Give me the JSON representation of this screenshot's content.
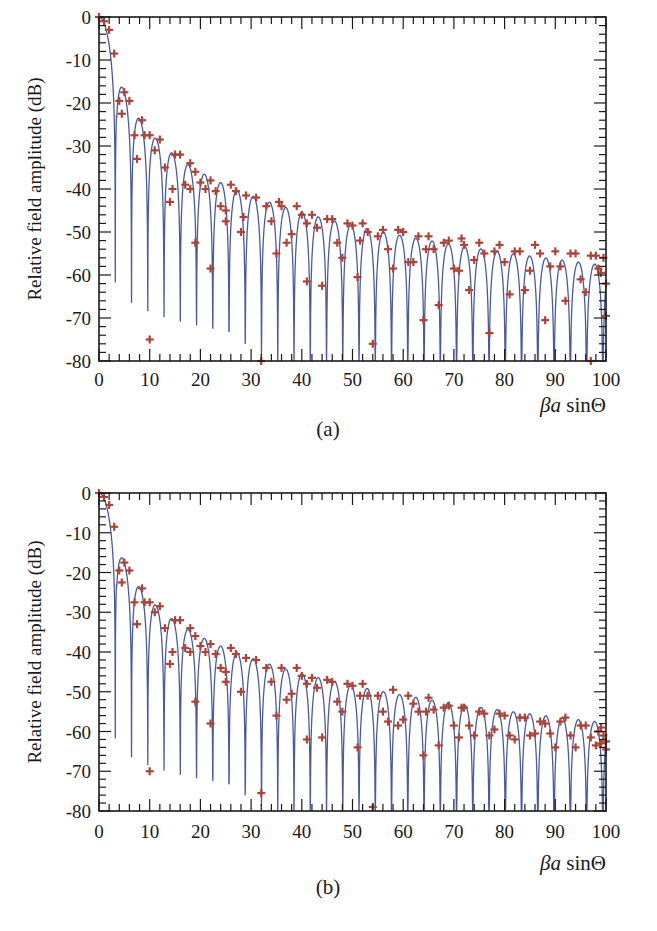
{
  "figure": {
    "panels": [
      {
        "id": "a",
        "caption": "(a)",
        "ylabel": "Relative field amplitude (dB)",
        "xlabel_prefix": "βa",
        "xlabel_func": "sin",
        "xlabel_var": "Θ"
      },
      {
        "id": "b",
        "caption": "(b)",
        "ylabel": "Relative field amplitude (dB)",
        "xlabel_prefix": "βa",
        "xlabel_func": "sin",
        "xlabel_var": "Θ"
      }
    ],
    "x_ticks": [
      "0",
      "10",
      "20",
      "30",
      "40",
      "50",
      "60",
      "70",
      "80",
      "90",
      "100"
    ],
    "y_ticks": [
      "0",
      "-10",
      "-20",
      "-30",
      "-40",
      "-50",
      "-60",
      "-70",
      "-80"
    ],
    "colors": {
      "line": "#4a5a9a",
      "marker": "#a8443a",
      "axis": "#1a1a1a"
    }
  },
  "chart_data": [
    {
      "type": "line",
      "title": "(a)",
      "xlabel": "βa sinΘ",
      "ylabel": "Relative field amplitude (dB)",
      "xlim": [
        0,
        100
      ],
      "ylim": [
        -80,
        0
      ],
      "grid": false,
      "series": [
        {
          "name": "theory (line)",
          "kind": "line",
          "description": "Sidelobe pattern with nulls at ~3.8, 7.0, 10.2, 13.3, 16.5, ... spacing ~pi; peaks decay from 0 dB to about -56 dB at x=100",
          "peaks": [
            [
              0,
              0
            ],
            [
              5.1,
              -17.6
            ],
            [
              8.4,
              -24
            ],
            [
              11.6,
              -28
            ],
            [
              14.8,
              -31.5
            ],
            [
              17.9,
              -34
            ],
            [
              21.1,
              -36
            ],
            [
              24.2,
              -38
            ],
            [
              27.4,
              -39.5
            ],
            [
              30.5,
              -41
            ],
            [
              33.7,
              -42.5
            ],
            [
              36.8,
              -43.5
            ],
            [
              40,
              -44.5
            ],
            [
              43.1,
              -45.5
            ],
            [
              46.3,
              -46.5
            ],
            [
              49.4,
              -47.5
            ],
            [
              52.6,
              -48
            ],
            [
              55.7,
              -49
            ],
            [
              58.9,
              -49.5
            ],
            [
              62,
              -50
            ],
            [
              65.2,
              -50.5
            ],
            [
              68.3,
              -51
            ],
            [
              71.5,
              -51.5
            ],
            [
              74.6,
              -52
            ],
            [
              77.8,
              -52.5
            ],
            [
              80.9,
              -53
            ],
            [
              84.1,
              -53.5
            ],
            [
              87.2,
              -54
            ],
            [
              90.4,
              -54.5
            ],
            [
              93.5,
              -55
            ],
            [
              96.7,
              -55.5
            ],
            [
              99.8,
              -56
            ]
          ]
        },
        {
          "name": "computed (markers)",
          "kind": "scatter",
          "marker": "+",
          "points": [
            [
              0,
              0
            ],
            [
              1,
              -1
            ],
            [
              2,
              -3
            ],
            [
              3,
              -8.5
            ],
            [
              4,
              -19.5
            ],
            [
              4.5,
              -22.5
            ],
            [
              5,
              -17.5
            ],
            [
              6,
              -19.5
            ],
            [
              7,
              -27.5
            ],
            [
              7.5,
              -33
            ],
            [
              8.5,
              -24
            ],
            [
              9,
              -27.5
            ],
            [
              10,
              -75
            ],
            [
              10,
              -27.5
            ],
            [
              11,
              -31
            ],
            [
              12,
              -28.5
            ],
            [
              13,
              -35
            ],
            [
              14,
              -43
            ],
            [
              14.5,
              -40
            ],
            [
              15,
              -32
            ],
            [
              16,
              -32
            ],
            [
              17,
              -39
            ],
            [
              18,
              -40
            ],
            [
              18,
              -34
            ],
            [
              19,
              -36
            ],
            [
              19,
              -52.5
            ],
            [
              20,
              -38.5
            ],
            [
              21,
              -40
            ],
            [
              22,
              -38
            ],
            [
              22,
              -58.5
            ],
            [
              23,
              -40.5
            ],
            [
              24,
              -44
            ],
            [
              25,
              -45
            ],
            [
              25,
              -47.5
            ],
            [
              26,
              -39
            ],
            [
              27,
              -40.5
            ],
            [
              28,
              -50
            ],
            [
              28.5,
              -46.5
            ],
            [
              29,
              -41.5
            ],
            [
              31,
              -42
            ],
            [
              32,
              -80
            ],
            [
              33,
              -44
            ],
            [
              34,
              -47.5
            ],
            [
              35,
              -55
            ],
            [
              35.5,
              -43
            ],
            [
              36,
              -44
            ],
            [
              37,
              -52.5
            ],
            [
              38,
              -50.5
            ],
            [
              39,
              -44
            ],
            [
              40,
              -46
            ],
            [
              41,
              -61.5
            ],
            [
              41,
              -48
            ],
            [
              42,
              -46
            ],
            [
              43,
              -49
            ],
            [
              44,
              -62.5
            ],
            [
              45,
              -47
            ],
            [
              46,
              -47
            ],
            [
              47,
              -52.5
            ],
            [
              48,
              -56
            ],
            [
              49,
              -48
            ],
            [
              50,
              -48.5
            ],
            [
              51,
              -60.5
            ],
            [
              51.5,
              -52
            ],
            [
              52,
              -48
            ],
            [
              53,
              -50
            ],
            [
              54,
              -76
            ],
            [
              55,
              -51
            ],
            [
              56,
              -49.5
            ],
            [
              57,
              -54
            ],
            [
              58,
              -58.5
            ],
            [
              59,
              -49.5
            ],
            [
              60,
              -50
            ],
            [
              61,
              -57
            ],
            [
              62,
              -57
            ],
            [
              63,
              -51
            ],
            [
              64,
              -70.5
            ],
            [
              64.5,
              -54
            ],
            [
              65,
              -51
            ],
            [
              66,
              -54
            ],
            [
              67,
              -67
            ],
            [
              68,
              -52.5
            ],
            [
              69,
              -52
            ],
            [
              70,
              -58.5
            ],
            [
              71,
              -59
            ],
            [
              71.5,
              -51.5
            ],
            [
              72,
              -53
            ],
            [
              73,
              -63.5
            ],
            [
              74,
              -56.5
            ],
            [
              75,
              -52.5
            ],
            [
              76,
              -55
            ],
            [
              77,
              -73.5
            ],
            [
              78,
              -54.5
            ],
            [
              79,
              -53
            ],
            [
              80,
              -57
            ],
            [
              81,
              -64.5
            ],
            [
              82,
              -54.5
            ],
            [
              83,
              -54.5
            ],
            [
              84,
              -63.5
            ],
            [
              85,
              -59
            ],
            [
              86,
              -53
            ],
            [
              87,
              -55
            ],
            [
              88,
              -70.5
            ],
            [
              89,
              -58
            ],
            [
              90,
              -54.5
            ],
            [
              91,
              -58
            ],
            [
              92,
              -66
            ],
            [
              93,
              -55
            ],
            [
              94,
              -55
            ],
            [
              95,
              -61
            ],
            [
              96,
              -64
            ],
            [
              97,
              -55.5
            ],
            [
              98,
              -55.5
            ],
            [
              99,
              -59.5
            ],
            [
              100,
              -69.5
            ],
            [
              98.5,
              -58.5
            ],
            [
              97,
              -80
            ],
            [
              99.5,
              -56
            ],
            [
              100,
              -62
            ]
          ]
        }
      ]
    },
    {
      "type": "line",
      "title": "(b)",
      "xlabel": "βa sinΘ",
      "ylabel": "Relative field amplitude (dB)",
      "xlim": [
        0,
        100
      ],
      "ylim": [
        -80,
        0
      ],
      "grid": false,
      "series": [
        {
          "name": "theory (line)",
          "kind": "line",
          "description": "Same analytic pattern as panel (a)"
        },
        {
          "name": "computed (markers)",
          "kind": "scatter",
          "marker": "+",
          "points": [
            [
              0,
              0
            ],
            [
              1,
              -1
            ],
            [
              2,
              -3
            ],
            [
              3,
              -8.5
            ],
            [
              4,
              -19.5
            ],
            [
              4.5,
              -22.5
            ],
            [
              5,
              -17.5
            ],
            [
              6,
              -19.5
            ],
            [
              7,
              -27.5
            ],
            [
              7.5,
              -33
            ],
            [
              8.5,
              -24
            ],
            [
              9,
              -27.5
            ],
            [
              10,
              -70
            ],
            [
              10,
              -27.5
            ],
            [
              11,
              -30
            ],
            [
              12,
              -28.5
            ],
            [
              13,
              -34
            ],
            [
              14,
              -43
            ],
            [
              14.5,
              -40
            ],
            [
              15,
              -32
            ],
            [
              16,
              -32
            ],
            [
              17,
              -39
            ],
            [
              18,
              -40
            ],
            [
              18,
              -34
            ],
            [
              19,
              -36
            ],
            [
              19,
              -52.5
            ],
            [
              20,
              -38.5
            ],
            [
              21,
              -40
            ],
            [
              22,
              -38
            ],
            [
              22,
              -58
            ],
            [
              23,
              -40.5
            ],
            [
              24,
              -44
            ],
            [
              25,
              -45
            ],
            [
              25,
              -47.5
            ],
            [
              26,
              -39
            ],
            [
              27,
              -40.5
            ],
            [
              28,
              -50
            ],
            [
              29,
              -41.5
            ],
            [
              31,
              -42
            ],
            [
              32,
              -75.5
            ],
            [
              33,
              -44
            ],
            [
              34,
              -47.5
            ],
            [
              35,
              -56
            ],
            [
              36,
              -44
            ],
            [
              37,
              -52
            ],
            [
              38,
              -50.5
            ],
            [
              39,
              -44
            ],
            [
              40,
              -46
            ],
            [
              41,
              -62
            ],
            [
              41,
              -48
            ],
            [
              42,
              -46.5
            ],
            [
              43,
              -49
            ],
            [
              44,
              -61.5
            ],
            [
              45,
              -47
            ],
            [
              46,
              -47.5
            ],
            [
              47,
              -52.5
            ],
            [
              48,
              -55
            ],
            [
              49,
              -48
            ],
            [
              50,
              -48.5
            ],
            [
              51,
              -64
            ],
            [
              51.5,
              -51
            ],
            [
              52,
              -48
            ],
            [
              53,
              -51
            ],
            [
              54,
              -79
            ],
            [
              55,
              -51
            ],
            [
              56,
              -55
            ],
            [
              57,
              -57.5
            ],
            [
              58,
              -49.5
            ],
            [
              59,
              -58.5
            ],
            [
              60,
              -57
            ],
            [
              61,
              -51
            ],
            [
              62,
              -53
            ],
            [
              63,
              -55
            ],
            [
              64,
              -66
            ],
            [
              64.5,
              -55
            ],
            [
              65,
              -51.5
            ],
            [
              66,
              -54.5
            ],
            [
              67,
              -63.5
            ],
            [
              68,
              -54
            ],
            [
              69,
              -53.5
            ],
            [
              70,
              -58.5
            ],
            [
              71,
              -61.5
            ],
            [
              71.5,
              -54
            ],
            [
              72,
              -54
            ],
            [
              73,
              -58.5
            ],
            [
              74,
              -61
            ],
            [
              75,
              -55
            ],
            [
              76,
              -55.5
            ],
            [
              77,
              -61
            ],
            [
              78,
              -59.5
            ],
            [
              79,
              -55.5
            ],
            [
              80,
              -56
            ],
            [
              81,
              -61
            ],
            [
              82,
              -62
            ],
            [
              83,
              -56.5
            ],
            [
              84,
              -56.5
            ],
            [
              85,
              -61
            ],
            [
              86,
              -60.5
            ],
            [
              87,
              -57.5
            ],
            [
              88,
              -58
            ],
            [
              89,
              -60.5
            ],
            [
              90,
              -64
            ],
            [
              91,
              -57.5
            ],
            [
              92,
              -56.5
            ],
            [
              93,
              -61
            ],
            [
              94,
              -64
            ],
            [
              95,
              -58.5
            ],
            [
              96,
              -58.5
            ],
            [
              97,
              -61.5
            ],
            [
              98,
              -63.5
            ],
            [
              98.5,
              -60
            ],
            [
              99,
              -59
            ],
            [
              99.5,
              -61
            ],
            [
              100,
              -64.5
            ],
            [
              99,
              -63
            ],
            [
              100,
              -62.5
            ]
          ]
        }
      ]
    }
  ]
}
